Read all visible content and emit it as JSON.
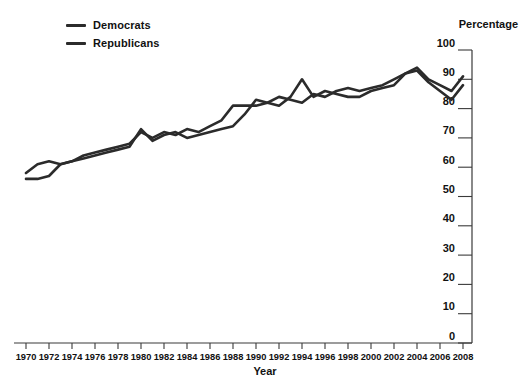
{
  "chart_data": {
    "type": "line",
    "title": "",
    "xlabel": "Year",
    "ylabel": "Percentage",
    "xlim": [
      1970,
      2008
    ],
    "ylim": [
      0,
      100
    ],
    "yticks": [
      0,
      10,
      20,
      30,
      40,
      50,
      60,
      70,
      80,
      90,
      100
    ],
    "xticks": [
      1970,
      1972,
      1974,
      1976,
      1978,
      1980,
      1982,
      1984,
      1986,
      1988,
      1990,
      1992,
      1994,
      1996,
      1998,
      2000,
      2002,
      2004,
      2006,
      2008
    ],
    "grid": false,
    "legend_position": "top-left",
    "x": [
      1970,
      1971,
      1972,
      1973,
      1974,
      1975,
      1976,
      1977,
      1978,
      1979,
      1980,
      1981,
      1982,
      1983,
      1984,
      1985,
      1986,
      1987,
      1988,
      1989,
      1990,
      1991,
      1992,
      1993,
      1994,
      1995,
      1996,
      1997,
      1998,
      1999,
      2000,
      2001,
      2002,
      2003,
      2004,
      2005,
      2006,
      2007,
      2008
    ],
    "series": [
      {
        "name": "Democrats",
        "color": "#2b2b2b",
        "values": [
          58,
          61,
          62,
          61,
          62,
          64,
          65,
          66,
          67,
          68,
          72,
          70,
          72,
          71,
          73,
          72,
          74,
          76,
          81,
          81,
          81,
          82,
          84,
          83,
          82,
          85,
          84,
          86,
          87,
          86,
          87,
          88,
          90,
          92,
          94,
          90,
          88,
          86,
          91
        ]
      },
      {
        "name": "Republicans",
        "color": "#2b2b2b",
        "values": [
          56,
          56,
          57,
          61,
          62,
          63,
          64,
          65,
          66,
          67,
          73,
          69,
          71,
          72,
          70,
          71,
          72,
          73,
          74,
          78,
          83,
          82,
          81,
          84,
          90,
          84,
          86,
          85,
          84,
          84,
          86,
          87,
          88,
          92,
          93,
          89,
          86,
          83,
          88
        ]
      }
    ]
  },
  "legend": {
    "items": [
      {
        "label": "Democrats"
      },
      {
        "label": "Republicans"
      }
    ]
  },
  "axes": {
    "y_axis_title": "Percentage",
    "x_axis_title": "Year"
  }
}
